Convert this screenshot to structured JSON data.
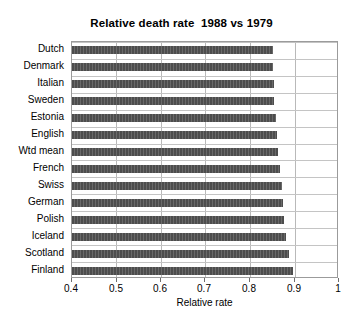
{
  "chart_data": {
    "type": "bar",
    "orientation": "horizontal",
    "title": "Relative death rate  1988 vs 1979",
    "xlabel": "Relative rate",
    "ylabel": "",
    "xlim": [
      0.4,
      1.0
    ],
    "xticks": [
      0.4,
      0.5,
      0.6,
      0.7,
      0.8,
      0.9,
      1
    ],
    "xticklabels": [
      "0.4",
      "0.5",
      "0.6",
      "0.7",
      "0.8",
      "0.9",
      "1"
    ],
    "grid": "vertical",
    "legend": "none",
    "bar_color": "#4d4d4d",
    "categories": [
      "Dutch",
      "Denmark",
      "Italian",
      "Sweden",
      "Estonia",
      "English",
      "Wtd mean",
      "French",
      "Swiss",
      "German",
      "Polish",
      "Iceland",
      "Scotland",
      "Finland"
    ],
    "values": [
      0.851,
      0.852,
      0.853,
      0.855,
      0.858,
      0.861,
      0.864,
      0.867,
      0.871,
      0.874,
      0.877,
      0.881,
      0.888,
      0.897
    ]
  }
}
